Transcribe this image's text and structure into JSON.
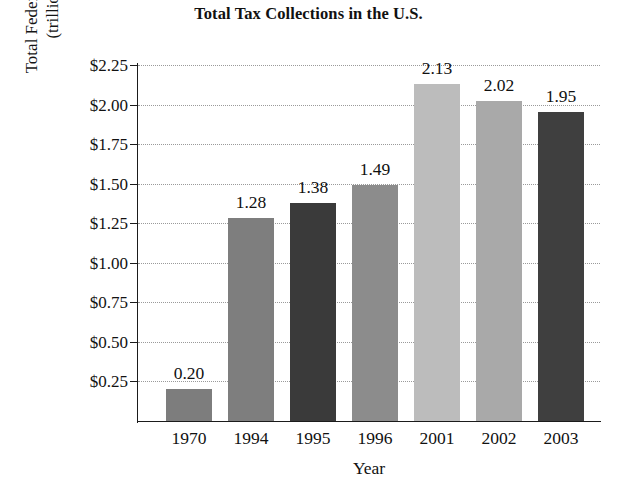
{
  "chart_data": {
    "type": "bar",
    "title": "Total Tax Collections in the U.S.",
    "xlabel": "Year",
    "ylabel": "Total Federal Taxes Collected (trillions of dollars)",
    "ylabel_line1": "Total Federal Taxes Collected",
    "ylabel_line2": "(trillions of dollars)",
    "categories": [
      "1970",
      "1994",
      "1995",
      "1996",
      "2001",
      "2002",
      "2003"
    ],
    "values": [
      0.2,
      1.28,
      1.38,
      1.49,
      2.13,
      2.02,
      1.95
    ],
    "value_labels": [
      "0.20",
      "1.28",
      "1.38",
      "1.49",
      "2.13",
      "2.02",
      "1.95"
    ],
    "bar_colors": [
      "#7d7d7d",
      "#7e7e7e",
      "#3a3a3a",
      "#8c8c8c",
      "#bcbcbc",
      "#a9a9a9",
      "#3f3f3f"
    ],
    "ylim": [
      0,
      2.25
    ],
    "ytick_values": [
      2.25,
      2.0,
      1.75,
      1.5,
      1.25,
      1.0,
      0.75,
      0.5,
      0.25
    ],
    "ytick_labels": [
      "$2.25",
      "$2.00",
      "$1.75",
      "$1.50",
      "$1.25",
      "$1.00",
      "$0.75",
      "$0.50",
      "$0.25"
    ],
    "grid": true,
    "grid_style": "dotted",
    "legend": false,
    "axis_color": "#1b1b1b",
    "background": "#ffffff"
  }
}
